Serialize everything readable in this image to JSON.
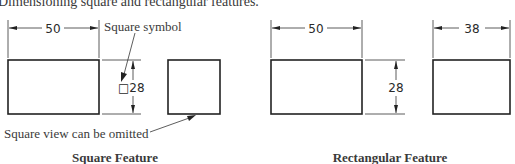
{
  "figure": {
    "caption": "Dimensioning square and rectangular features.",
    "panels": [
      {
        "title": "Square Feature",
        "front_view": {
          "width_dim": "50",
          "height_dim": "□28"
        },
        "side_view": {
          "note": "Square view can be omitted"
        },
        "callouts": {
          "square_symbol": "Square symbol",
          "omit_note": "Square view can be omitted"
        }
      },
      {
        "title": "Rectangular Feature",
        "front_view": {
          "width_dim": "50",
          "height_dim": "28"
        },
        "side_view": {
          "width_dim": "38"
        }
      }
    ]
  }
}
